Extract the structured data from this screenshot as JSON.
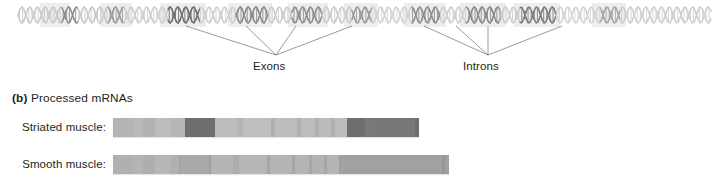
{
  "figure": {
    "dna": {
      "icon": "dna-double-helix",
      "start_x": 18,
      "end_x": 711,
      "center_y": 15,
      "amplitude": 8,
      "period": 15.6,
      "description": "Gene double helix with alternating exon (dark) and intron (light) segments",
      "segments": [
        {
          "type": "intron",
          "x0": 18,
          "x1": 62,
          "shade": "#c9c9c9"
        },
        {
          "type": "exon",
          "x0": 62,
          "x1": 78,
          "shade": "#8d8d8d"
        },
        {
          "type": "intron",
          "x0": 78,
          "x1": 108,
          "shade": "#c9c9c9"
        },
        {
          "type": "exon",
          "x0": 108,
          "x1": 124,
          "shade": "#9a9a9a"
        },
        {
          "type": "intron",
          "x0": 124,
          "x1": 168,
          "shade": "#cfcfcf"
        },
        {
          "type": "exon",
          "x0": 168,
          "x1": 200,
          "shade": "#6f6f6f"
        },
        {
          "type": "intron",
          "x0": 200,
          "x1": 236,
          "shade": "#cfcfcf"
        },
        {
          "type": "exon",
          "x0": 236,
          "x1": 268,
          "shade": "#8a8a8a"
        },
        {
          "type": "intron",
          "x0": 268,
          "x1": 292,
          "shade": "#cccccc"
        },
        {
          "type": "exon",
          "x0": 292,
          "x1": 322,
          "shade": "#8f8f8f"
        },
        {
          "type": "intron",
          "x0": 322,
          "x1": 352,
          "shade": "#cccccc"
        },
        {
          "type": "exon",
          "x0": 352,
          "x1": 372,
          "shade": "#9c9c9c"
        },
        {
          "type": "intron",
          "x0": 372,
          "x1": 412,
          "shade": "#d2d2d2"
        },
        {
          "type": "exon",
          "x0": 412,
          "x1": 440,
          "shade": "#8e8e8e"
        },
        {
          "type": "intron",
          "x0": 440,
          "x1": 466,
          "shade": "#cfcfcf"
        },
        {
          "type": "exon",
          "x0": 466,
          "x1": 500,
          "shade": "#8a8a8a"
        },
        {
          "type": "intron",
          "x0": 500,
          "x1": 520,
          "shade": "#cdcdcd"
        },
        {
          "type": "exon",
          "x0": 520,
          "x1": 556,
          "shade": "#7d7d7d"
        },
        {
          "type": "intron",
          "x0": 556,
          "x1": 600,
          "shade": "#d4d4d4"
        },
        {
          "type": "exon",
          "x0": 600,
          "x1": 620,
          "shade": "#a6a6a6"
        },
        {
          "type": "intron",
          "x0": 620,
          "x1": 711,
          "shade": "#cfcfcf"
        }
      ],
      "shadow_blocks": [
        {
          "x0": 40,
          "x1": 70
        },
        {
          "x0": 100,
          "x1": 132
        },
        {
          "x0": 160,
          "x1": 206
        },
        {
          "x0": 228,
          "x1": 272
        },
        {
          "x0": 288,
          "x1": 328
        },
        {
          "x0": 344,
          "x1": 378
        },
        {
          "x0": 404,
          "x1": 446
        },
        {
          "x0": 460,
          "x1": 506
        },
        {
          "x0": 514,
          "x1": 560
        },
        {
          "x0": 592,
          "x1": 626
        }
      ]
    },
    "leaders": {
      "exons": {
        "converge_x": 276,
        "converge_y": 55,
        "anchors_x": [
          186,
          246,
          296,
          352
        ]
      },
      "introns": {
        "converge_x": 488,
        "converge_y": 55,
        "anchors_x": [
          424,
          456,
          488,
          562
        ]
      },
      "anchor_y": 26,
      "color": "#6e6e6e"
    },
    "labels": {
      "exons": "Exons",
      "introns": "Introns"
    }
  },
  "panel_b": {
    "letter": "(b)",
    "title": "Processed mRNAs",
    "rows": [
      {
        "label": "Striated muscle:",
        "name": "striated-muscle",
        "bar_left": 113,
        "segments": [
          {
            "width": 20,
            "color": "#b4b4b4"
          },
          {
            "width": 10,
            "color": "#b9b9b9"
          },
          {
            "width": 12,
            "color": "#b2b2b2"
          },
          {
            "width": 16,
            "color": "#bcbcbc"
          },
          {
            "width": 14,
            "color": "#b6b6b6"
          },
          {
            "width": 30,
            "color": "#6f6f6f"
          },
          {
            "width": 22,
            "color": "#bdbdbd"
          },
          {
            "width": 6,
            "color": "#b5b5b5"
          },
          {
            "width": 28,
            "color": "#bfbfbf"
          },
          {
            "width": 4,
            "color": "#b0b0b0"
          },
          {
            "width": 22,
            "color": "#bdbdbd"
          },
          {
            "width": 4,
            "color": "#b0b0b0"
          },
          {
            "width": 14,
            "color": "#bdbdbd"
          },
          {
            "width": 4,
            "color": "#b0b0b0"
          },
          {
            "width": 12,
            "color": "#bbbbbb"
          },
          {
            "width": 4,
            "color": "#b0b0b0"
          },
          {
            "width": 12,
            "color": "#bdbdbd"
          },
          {
            "width": 18,
            "color": "#6f6f6f"
          },
          {
            "width": 4,
            "color": "#7a7a7a"
          },
          {
            "width": 46,
            "color": "#787878"
          },
          {
            "width": 4,
            "color": "#6e6e6e"
          }
        ]
      },
      {
        "label": "Smooth muscle:",
        "name": "smooth-muscle",
        "bar_left": 113,
        "segments": [
          {
            "width": 20,
            "color": "#b0b0b0"
          },
          {
            "width": 10,
            "color": "#b4b4b4"
          },
          {
            "width": 12,
            "color": "#aeaeae"
          },
          {
            "width": 16,
            "color": "#b6b6b6"
          },
          {
            "width": 8,
            "color": "#b0b0b0"
          },
          {
            "width": 2,
            "color": "#a4a4a4"
          },
          {
            "width": 28,
            "color": "#a9a9a9"
          },
          {
            "width": 2,
            "color": "#9f9f9f"
          },
          {
            "width": 22,
            "color": "#b4b4b4"
          },
          {
            "width": 6,
            "color": "#adadad"
          },
          {
            "width": 28,
            "color": "#b6b6b6"
          },
          {
            "width": 3,
            "color": "#a6a6a6"
          },
          {
            "width": 22,
            "color": "#b4b4b4"
          },
          {
            "width": 3,
            "color": "#a6a6a6"
          },
          {
            "width": 14,
            "color": "#b4b4b4"
          },
          {
            "width": 3,
            "color": "#a6a6a6"
          },
          {
            "width": 12,
            "color": "#b2b2b2"
          },
          {
            "width": 3,
            "color": "#a6a6a6"
          },
          {
            "width": 12,
            "color": "#b4b4b4"
          },
          {
            "width": 3,
            "color": "#a0a0a0"
          },
          {
            "width": 100,
            "color": "#a1a1a1"
          },
          {
            "width": 3,
            "color": "#979797"
          },
          {
            "width": 4,
            "color": "#a1a1a1"
          }
        ]
      }
    ]
  },
  "colors": {
    "background": "#ffffff",
    "text": "#231f20",
    "leader_line": "#6e6e6e"
  }
}
